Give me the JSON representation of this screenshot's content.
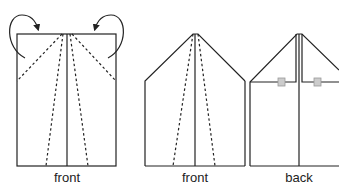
{
  "panels": [
    {
      "id": "panel-1",
      "label": "front"
    },
    {
      "id": "panel-2",
      "label": "front"
    },
    {
      "id": "panel-3",
      "label": "back"
    }
  ],
  "colors": {
    "stroke": "#222222",
    "tab_fill": "#cccccc",
    "tab_stroke": "#999999"
  }
}
